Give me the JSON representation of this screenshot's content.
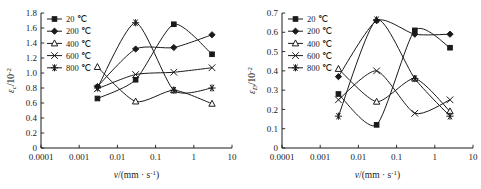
{
  "figure": {
    "panels": [
      "left",
      "right"
    ]
  },
  "chart_data": [
    {
      "id": "left",
      "type": "line",
      "title": "",
      "xlabel": "v/(mm · s⁻¹)",
      "ylabel": "εc/10⁻²",
      "ylabel_parts": {
        "base": "ε",
        "sub": "c",
        "div": "/10",
        "sup": "-2"
      },
      "xlabel_parts": {
        "v": "v",
        "open": "/(mm · s",
        "sup": "-1",
        "close": ")"
      },
      "xscale": "log",
      "xlim": [
        0.0001,
        10
      ],
      "ylim": [
        0,
        1.8
      ],
      "xticks": [
        0.0001,
        0.001,
        0.01,
        0.1,
        1,
        10
      ],
      "xticklabels": [
        "0.0001",
        "0.001",
        "0.01",
        "0.1",
        "1",
        "10"
      ],
      "yticks": [
        0,
        0.2,
        0.4,
        0.6,
        0.8,
        1.0,
        1.2,
        1.4,
        1.6,
        1.8
      ],
      "yticklabels": [
        "0",
        "0.2",
        "0.4",
        "0.6",
        "0.8",
        "1.0",
        "1.2",
        "1.4",
        "1.6",
        "1.8"
      ],
      "grid": false,
      "legend_position": "upper-left",
      "series": [
        {
          "name": "20 ℃",
          "marker": "filled-square",
          "x": [
            0.003,
            0.03,
            0.3,
            3
          ],
          "values": [
            0.66,
            0.91,
            1.65,
            1.25
          ]
        },
        {
          "name": "200 ℃",
          "marker": "filled-diamond",
          "x": [
            0.003,
            0.03,
            0.3,
            3
          ],
          "values": [
            0.82,
            1.32,
            1.34,
            1.51
          ]
        },
        {
          "name": "400 ℃",
          "marker": "open-triangle",
          "x": [
            0.003,
            0.03,
            0.3,
            3
          ],
          "values": [
            1.08,
            0.62,
            0.77,
            0.59
          ]
        },
        {
          "name": "600 ℃",
          "marker": "cross-x",
          "x": [
            0.003,
            0.03,
            0.3,
            3
          ],
          "values": [
            0.79,
            0.98,
            1.01,
            1.07
          ]
        },
        {
          "name": "800 ℃",
          "marker": "star-asterisk",
          "x": [
            0.003,
            0.03,
            0.3,
            3
          ],
          "values": [
            0.8,
            1.67,
            0.77,
            0.8
          ]
        }
      ]
    },
    {
      "id": "right",
      "type": "line",
      "title": "",
      "xlabel": "v/(mm · s⁻¹)",
      "ylabel": "εD/10⁻²",
      "ylabel_parts": {
        "base": "ε",
        "sub": "D",
        "div": "/10",
        "sup": "-2"
      },
      "xlabel_parts": {
        "v": "v",
        "open": "/(mm · s",
        "sup": "-1",
        "close": ")"
      },
      "xscale": "log",
      "xlim": [
        0.0001,
        10
      ],
      "ylim": [
        0,
        0.7
      ],
      "xticks": [
        0.0001,
        0.001,
        0.01,
        0.1,
        1,
        10
      ],
      "xticklabels": [
        "0.0001",
        "0.001",
        "0.01",
        "0.1",
        "1",
        "10"
      ],
      "yticks": [
        0,
        0.1,
        0.2,
        0.3,
        0.4,
        0.5,
        0.6,
        0.7
      ],
      "yticklabels": [
        "0",
        "0.1",
        "0.2",
        "0.3",
        "0.4",
        "0.5",
        "0.6",
        "0.7"
      ],
      "grid": false,
      "legend_position": "upper-left",
      "series": [
        {
          "name": "20 ℃",
          "marker": "filled-square",
          "x": [
            0.003,
            0.03,
            0.3,
            2.5
          ],
          "values": [
            0.28,
            0.12,
            0.61,
            0.52
          ]
        },
        {
          "name": "200 ℃",
          "marker": "filled-diamond",
          "x": [
            0.003,
            0.03,
            0.3,
            2.5
          ],
          "values": [
            0.37,
            0.66,
            0.59,
            0.59
          ]
        },
        {
          "name": "400 ℃",
          "marker": "open-triangle",
          "x": [
            0.003,
            0.03,
            0.3,
            2.5
          ],
          "values": [
            0.41,
            0.24,
            0.36,
            0.19
          ]
        },
        {
          "name": "600 ℃",
          "marker": "cross-x",
          "x": [
            0.003,
            0.03,
            0.3,
            2.5
          ],
          "values": [
            0.25,
            0.4,
            0.18,
            0.25
          ]
        },
        {
          "name": "800 ℃",
          "marker": "star-asterisk",
          "x": [
            0.003,
            0.03,
            0.3,
            2.5
          ],
          "values": [
            0.165,
            0.665,
            0.36,
            0.165
          ]
        }
      ]
    }
  ]
}
